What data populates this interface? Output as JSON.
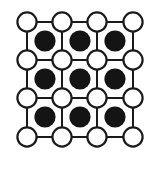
{
  "figure": {
    "type": "lattice-diagram",
    "canvas": {
      "width": 152,
      "height": 189
    },
    "background_color": "#ffffff"
  },
  "chart_data": {
    "type": "scatter",
    "xlabel": "",
    "ylabel": "",
    "xlim": [
      0,
      152
    ],
    "ylim": [
      0,
      189
    ],
    "grid": true,
    "legend": "none",
    "annotations": [],
    "series": [
      {
        "name": "open-circle-node",
        "marker": "circle-open",
        "fill_color": "#ffffff",
        "stroke_color": "#1a1a1a",
        "stroke_width": 2.2,
        "radius": 9.6,
        "rows": 4,
        "cols": 4,
        "count": 16,
        "x": [
          27,
          62,
          97,
          133,
          27,
          62,
          97,
          133,
          27,
          62,
          97,
          133,
          27,
          62,
          97,
          133
        ],
        "y": [
          22,
          22,
          22,
          22,
          60,
          60,
          60,
          60,
          98,
          98,
          98,
          98,
          137,
          137,
          137,
          137
        ]
      },
      {
        "name": "filled-circle-node",
        "marker": "circle-filled",
        "fill_color": "#141414",
        "stroke_color": "#141414",
        "stroke_width": 0,
        "radius": 10.6,
        "rows": 3,
        "cols": 3,
        "count": 9,
        "x": [
          45,
          80,
          115,
          45,
          80,
          115,
          45,
          80,
          115
        ],
        "y": [
          41,
          41,
          41,
          79,
          79,
          79,
          117,
          117,
          117
        ]
      }
    ],
    "lattice_bonds": {
      "name": "lattice-bond",
      "stroke_color": "#1a1a1a",
      "stroke_width": 2.0,
      "horizontal_count": 12,
      "vertical_count": 12,
      "grid_x": [
        27,
        62,
        97,
        133
      ],
      "grid_y": [
        22,
        60,
        98,
        137
      ]
    }
  },
  "colors": {
    "background": "#ffffff",
    "line": "#1a1a1a",
    "open_node_fill": "#ffffff",
    "open_node_stroke": "#1a1a1a",
    "filled_node": "#141414"
  },
  "labels": {
    "open_node_name": "open-circle-node",
    "filled_node_name": "filled-circle-node",
    "bond_name": "lattice-bond"
  }
}
